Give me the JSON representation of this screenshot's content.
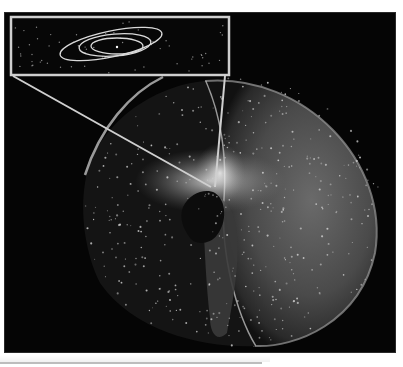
{
  "figure": {
    "elements": {
      "inset": "planetary-orbits-inset",
      "outer_shell": "spherical-oort-cloud",
      "inner_cloud": "inner-oort-cloud-torus",
      "center": "solar-system-core"
    },
    "colors": {
      "background": "#050505",
      "shell": "#8a8a8a",
      "inset_border": "#cfcfcf",
      "orbit": "#d9d9d9",
      "glow": "#ffffff"
    }
  }
}
